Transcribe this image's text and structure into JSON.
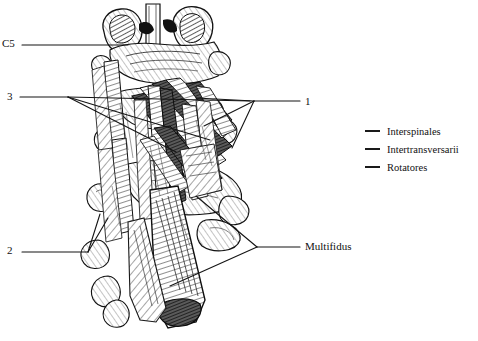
{
  "figure": {
    "background_color": "#ffffff",
    "line_color": "#1a1a1a",
    "ink_color": "#222222"
  },
  "callouts": [
    {
      "id": "c5",
      "label": "C5",
      "side": "left",
      "x": 2,
      "y": 38
    },
    {
      "id": "three",
      "label": "3",
      "side": "left",
      "x": 7,
      "y": 91
    },
    {
      "id": "two",
      "label": "2",
      "side": "left",
      "x": 7,
      "y": 245
    },
    {
      "id": "one",
      "label": "1",
      "side": "right",
      "x": 305,
      "y": 96
    },
    {
      "id": "multifidus",
      "label": "Multifidus",
      "side": "right",
      "x": 305,
      "y": 241
    }
  ],
  "legend": {
    "items": [
      {
        "key": "interspinales",
        "label": "Interspinales",
        "swatch": "line-swatch",
        "color": "#1a1a1a"
      },
      {
        "key": "intertransversarii",
        "label": "Intertransversarii",
        "swatch": "line-swatch",
        "color": "#1a1a1a"
      },
      {
        "key": "rotatores",
        "label": "Rotatores",
        "swatch": "line-swatch",
        "color": "#1a1a1a"
      }
    ]
  },
  "illustration": {
    "name": "cervical-vertebrae-deep-muscles",
    "description": "Pen-and-ink anatomical drawing of cervical vertebrae with deep paraspinal muscles",
    "structures": [
      "vertebra-C5-spinous-process",
      "superior-articular-facets",
      "transverse-processes",
      "interspinales-muscle-bundles",
      "intertransversarii-muscle-bundles",
      "rotatores-muscle-bundles",
      "multifidus-muscle-belly"
    ]
  }
}
